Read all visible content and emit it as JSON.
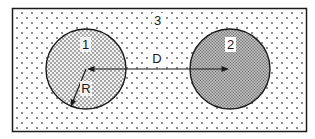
{
  "diagram": {
    "region_outer": {
      "label": "3"
    },
    "circle_1": {
      "label": "1",
      "radius_label": "R"
    },
    "circle_2": {
      "label": "2"
    },
    "distance": {
      "label": "D"
    }
  },
  "colors": {
    "stroke": "#1a1a1a",
    "background": "#ffffff",
    "dot_sparse": "#555555",
    "dot_dense": "#333333",
    "circle2_fill": "#b8b8b8"
  }
}
